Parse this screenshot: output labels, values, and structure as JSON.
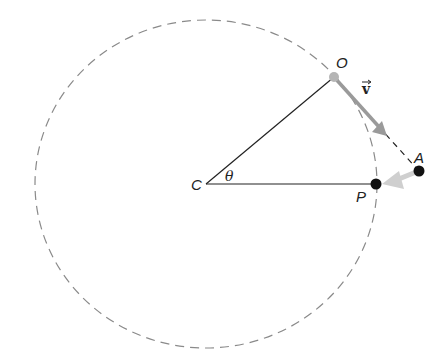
{
  "diagram": {
    "type": "circular-motion-geometry",
    "labels": {
      "center": "C",
      "start_point": "O",
      "end_point": "P",
      "tangent_point": "A",
      "angle": "θ",
      "velocity": "v"
    },
    "colors": {
      "circle": "#8a8a8a",
      "lines": "#222222",
      "dot": "#111111",
      "start_dot": "#b5b5b5",
      "velocity_arrow": "#9a9a9a",
      "fall_arrow": "#cfcfcf"
    }
  }
}
